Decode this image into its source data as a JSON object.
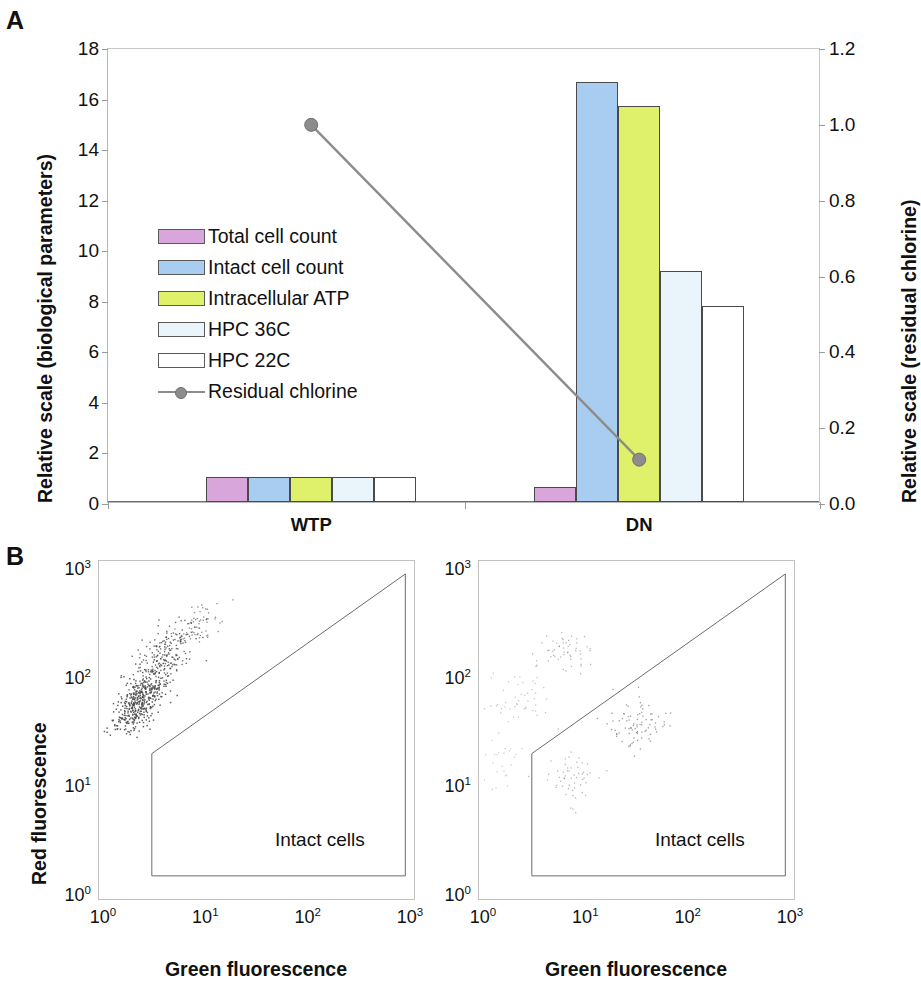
{
  "figure": {
    "panel_a_letter": "A",
    "panel_b_letter": "B"
  },
  "panelA": {
    "y_axis_left": {
      "title": "Relative scale (biological parameters)",
      "min": 0,
      "max": 18,
      "step": 2,
      "ticks": [
        "0",
        "2",
        "4",
        "6",
        "8",
        "10",
        "12",
        "14",
        "16",
        "18"
      ]
    },
    "y_axis_right": {
      "title": "Relative scale (residual chlorine)",
      "min": 0,
      "max": 1.2,
      "step": 0.2,
      "ticks": [
        "0.0",
        "0.2",
        "0.4",
        "0.6",
        "0.8",
        "1.0",
        "1.2"
      ]
    },
    "categories": [
      "WTP",
      "DN"
    ],
    "legend": [
      {
        "label": "Total cell count",
        "color": "#d9a6dc",
        "type": "bar"
      },
      {
        "label": "Intact cell count",
        "color": "#a8cdf0",
        "type": "bar"
      },
      {
        "label": "Intracellular ATP",
        "color": "#dff06a",
        "type": "bar"
      },
      {
        "label": "HPC 36C",
        "color": "#eaf4fb",
        "type": "bar"
      },
      {
        "label": "HPC 22C",
        "color": "#ffffff",
        "type": "bar"
      },
      {
        "label": "Residual chlorine",
        "color": "#8c8c8c",
        "type": "line"
      }
    ]
  },
  "panelB": {
    "plots": [
      {
        "group": "WTP",
        "x_title": "Green fluorescence",
        "y_title": "Red fluorescence",
        "gate_label": "Intact cells",
        "x_ticks": [
          "10⁰",
          "10¹",
          "10²",
          "10³"
        ],
        "y_ticks": [
          "10⁰",
          "10¹",
          "10²",
          "10³"
        ]
      },
      {
        "group": "DN",
        "x_title": "Green fluorescence",
        "y_title": "",
        "gate_label": "Intact cells",
        "x_ticks": [
          "10⁰",
          "10¹",
          "10²",
          "10³"
        ],
        "y_ticks": [
          "10⁰",
          "10¹",
          "10²",
          "10³"
        ]
      }
    ]
  },
  "chart_data": [
    {
      "type": "bar",
      "title": "Relative biological parameters and residual chlorine at WTP and DN",
      "xlabel": "",
      "ylabel": "Relative scale (biological parameters)",
      "ylabel_secondary": "Relative scale (residual chlorine)",
      "ylim": [
        0,
        18
      ],
      "ylim_secondary": [
        0,
        1.2
      ],
      "grid": false,
      "legend_position": "inside-left",
      "categories": [
        "WTP",
        "DN"
      ],
      "series": [
        {
          "name": "Total cell count",
          "color": "#d9a6dc",
          "axis": "left",
          "values": [
            1.0,
            0.6
          ]
        },
        {
          "name": "Intact cell count",
          "color": "#a8cdf0",
          "axis": "left",
          "values": [
            1.0,
            16.6
          ]
        },
        {
          "name": "Intracellular ATP",
          "color": "#dff06a",
          "axis": "left",
          "values": [
            1.0,
            15.65
          ]
        },
        {
          "name": "HPC 36C",
          "color": "#eaf4fb",
          "axis": "left",
          "values": [
            1.0,
            9.15
          ]
        },
        {
          "name": "HPC 22C",
          "color": "#ffffff",
          "axis": "left",
          "values": [
            1.0,
            7.75
          ]
        },
        {
          "name": "Residual chlorine",
          "color": "#8c8c8c",
          "axis": "right",
          "type": "line",
          "marker": "circle",
          "values": [
            1.0,
            0.117
          ]
        }
      ]
    },
    {
      "type": "scatter",
      "title": "WTP flow cytometry",
      "xlabel": "Green fluorescence",
      "ylabel": "Red fluorescence",
      "xscale": "log",
      "yscale": "log",
      "xlim": [
        1,
        1000
      ],
      "ylim": [
        1,
        1000
      ],
      "grid": false,
      "annotations": [
        "Intact cells"
      ],
      "cluster_description": "Dense elongated cluster from (1.7, 35) to (20, 400) along the diagonal, outside/above the intact-cells gate",
      "point_count": 620
    },
    {
      "type": "scatter",
      "title": "DN flow cytometry",
      "xlabel": "Green fluorescence",
      "ylabel": "",
      "xscale": "log",
      "yscale": "log",
      "xlim": [
        1,
        1000
      ],
      "ylim": [
        1,
        1000
      ],
      "grid": false,
      "annotations": [
        "Intact cells"
      ],
      "cluster_description": "Sparse scattered events; faint groups near (7,180), (2,60), (8,12) and a denser group near (30,35) inside the intact-cells gate",
      "point_count": 190
    }
  ]
}
